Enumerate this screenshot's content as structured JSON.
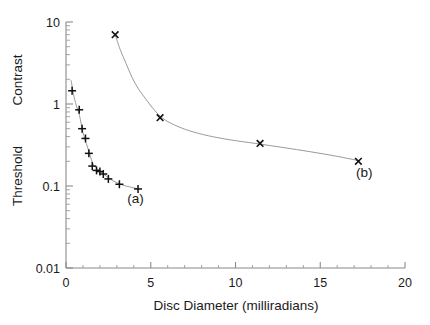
{
  "figure": {
    "background_color": "#ffffff",
    "axis_color": "#8a8a8a",
    "curve_color": "#9a9a9a",
    "marker_color": "#111111"
  },
  "axes": {
    "x_title": "Disc   Diameter   (milliradians)",
    "y_title_line1": "Threshold",
    "y_title_line2": "Contrast",
    "x_ticks": [
      "0",
      "5",
      "10",
      "15",
      "20"
    ],
    "x_tick_values": [
      0,
      5,
      10,
      15,
      20
    ],
    "y_ticks": [
      "10",
      "1",
      "0.1",
      "0.01"
    ],
    "y_tick_values": [
      10,
      1,
      0.1,
      0.01
    ]
  },
  "annotations": [
    {
      "text": "(a)",
      "x": 4.1,
      "y": 0.062
    },
    {
      "text": "(b)",
      "x": 17.6,
      "y": 0.128
    }
  ],
  "chart_data": {
    "type": "scatter",
    "title": "",
    "xlabel": "Disc   Diameter   (milliradians)",
    "ylabel": "Threshold Contrast",
    "xlim": [
      0,
      20
    ],
    "ylim": [
      0.01,
      10
    ],
    "yscale": "log",
    "xscale": "linear",
    "grid": false,
    "legend": "none",
    "series": [
      {
        "name": "(a)",
        "marker": "plus",
        "points": [
          {
            "x": 0.36,
            "y": 1.45
          },
          {
            "x": 0.78,
            "y": 0.85
          },
          {
            "x": 0.95,
            "y": 0.5
          },
          {
            "x": 1.15,
            "y": 0.38
          },
          {
            "x": 1.35,
            "y": 0.25
          },
          {
            "x": 1.55,
            "y": 0.175
          },
          {
            "x": 1.8,
            "y": 0.155
          },
          {
            "x": 2.0,
            "y": 0.15
          },
          {
            "x": 2.2,
            "y": 0.14
          },
          {
            "x": 2.5,
            "y": 0.122
          },
          {
            "x": 3.15,
            "y": 0.105
          },
          {
            "x": 4.25,
            "y": 0.092
          }
        ],
        "fit_curve": [
          {
            "x": 0.3,
            "y": 1.95
          },
          {
            "x": 0.45,
            "y": 1.3
          },
          {
            "x": 0.6,
            "y": 0.97
          },
          {
            "x": 0.8,
            "y": 0.72
          },
          {
            "x": 1.0,
            "y": 0.45
          },
          {
            "x": 1.2,
            "y": 0.33
          },
          {
            "x": 1.4,
            "y": 0.245
          },
          {
            "x": 1.6,
            "y": 0.185
          },
          {
            "x": 1.9,
            "y": 0.158
          },
          {
            "x": 2.2,
            "y": 0.141
          },
          {
            "x": 2.6,
            "y": 0.122
          },
          {
            "x": 3.2,
            "y": 0.105
          },
          {
            "x": 3.8,
            "y": 0.097
          },
          {
            "x": 4.3,
            "y": 0.092
          }
        ]
      },
      {
        "name": "(b)",
        "marker": "cross",
        "points": [
          {
            "x": 2.9,
            "y": 7.0
          },
          {
            "x": 5.55,
            "y": 0.68
          },
          {
            "x": 11.45,
            "y": 0.33
          },
          {
            "x": 17.25,
            "y": 0.2
          }
        ],
        "fit_curve": [
          {
            "x": 2.9,
            "y": 7.0
          },
          {
            "x": 3.2,
            "y": 4.6
          },
          {
            "x": 3.55,
            "y": 3.1
          },
          {
            "x": 3.9,
            "y": 2.1
          },
          {
            "x": 4.3,
            "y": 1.5
          },
          {
            "x": 4.75,
            "y": 1.12
          },
          {
            "x": 5.2,
            "y": 0.85
          },
          {
            "x": 5.7,
            "y": 0.67
          },
          {
            "x": 6.4,
            "y": 0.555
          },
          {
            "x": 7.3,
            "y": 0.47
          },
          {
            "x": 8.4,
            "y": 0.41
          },
          {
            "x": 9.7,
            "y": 0.365
          },
          {
            "x": 11.2,
            "y": 0.33
          },
          {
            "x": 12.8,
            "y": 0.295
          },
          {
            "x": 14.4,
            "y": 0.262
          },
          {
            "x": 15.9,
            "y": 0.232
          },
          {
            "x": 17.3,
            "y": 0.203
          }
        ]
      }
    ]
  }
}
